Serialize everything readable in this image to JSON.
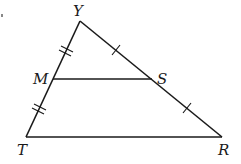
{
  "diagram": {
    "type": "triangle-midsegment",
    "stroke_color": "#1a1a1a",
    "vertices": {
      "Y": {
        "label": "Y",
        "x": 80,
        "y": 21
      },
      "T": {
        "label": "T",
        "x": 26,
        "y": 137
      },
      "R": {
        "label": "R",
        "x": 222,
        "y": 137
      },
      "M": {
        "label": "M",
        "x": 53,
        "y": 79
      },
      "S": {
        "label": "S",
        "x": 152,
        "y": 79
      }
    },
    "segments": [
      "YT",
      "YR",
      "TR",
      "MS"
    ],
    "congruence_marks": {
      "YM": "double",
      "MT": "double",
      "YS": "single",
      "SR": "single"
    }
  }
}
